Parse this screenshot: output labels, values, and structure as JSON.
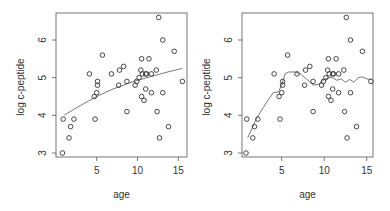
{
  "chart_data": [
    {
      "type": "scatter",
      "title": "",
      "xlabel": "age",
      "ylabel": "log c-peptide",
      "xlim": [
        0.5,
        15.8
      ],
      "ylim": [
        2.9,
        6.75
      ],
      "xticks": [
        5,
        10,
        15
      ],
      "yticks": [
        3,
        4,
        5,
        6
      ],
      "grid": false,
      "points": [
        [
          0.9,
          3.9
        ],
        [
          2.2,
          3.9
        ],
        [
          1.8,
          3.7
        ],
        [
          1.6,
          3.4
        ],
        [
          0.8,
          3.0
        ],
        [
          4.8,
          3.9
        ],
        [
          5.7,
          5.6
        ],
        [
          4.1,
          5.1
        ],
        [
          5.1,
          4.9
        ],
        [
          5.1,
          4.8
        ],
        [
          5.0,
          4.6
        ],
        [
          4.7,
          4.5
        ],
        [
          6.8,
          5.1
        ],
        [
          7.8,
          5.2
        ],
        [
          8.3,
          5.3
        ],
        [
          7.7,
          4.8
        ],
        [
          8.7,
          4.9
        ],
        [
          8.7,
          4.1
        ],
        [
          12.6,
          6.6
        ],
        [
          13.1,
          6.0
        ],
        [
          14.5,
          5.7
        ],
        [
          10.5,
          5.5
        ],
        [
          11.4,
          5.5
        ],
        [
          15.5,
          4.9
        ],
        [
          10.4,
          5.2
        ],
        [
          12.3,
          5.2
        ],
        [
          9.7,
          4.8
        ],
        [
          9.9,
          4.9
        ],
        [
          10.2,
          5.0
        ],
        [
          10.6,
          5.1
        ],
        [
          11.0,
          5.1
        ],
        [
          11.1,
          5.1
        ],
        [
          11.7,
          5.1
        ],
        [
          11.0,
          4.7
        ],
        [
          11.7,
          4.6
        ],
        [
          13.1,
          4.6
        ],
        [
          10.5,
          4.5
        ],
        [
          10.8,
          4.4
        ],
        [
          12.4,
          4.1
        ],
        [
          13.8,
          3.7
        ],
        [
          12.7,
          3.4
        ]
      ],
      "fit_line": {
        "name": "smooth fit",
        "x": [
          1.0,
          2.0,
          3.0,
          4.0,
          5.0,
          6.0,
          7.0,
          8.0,
          9.0,
          10.0,
          11.0,
          12.0,
          13.0,
          14.0,
          15.0,
          15.5
        ],
        "y": [
          4.0,
          4.13,
          4.26,
          4.38,
          4.5,
          4.6,
          4.7,
          4.78,
          4.86,
          4.93,
          4.99,
          5.05,
          5.11,
          5.17,
          5.22,
          5.25
        ]
      }
    },
    {
      "type": "scatter",
      "title": "",
      "xlabel": "age",
      "ylabel": "log c-peptide",
      "xlim": [
        0.5,
        15.8
      ],
      "ylim": [
        2.9,
        6.75
      ],
      "xticks": [
        5,
        10,
        15
      ],
      "yticks": [
        3,
        4,
        5,
        6
      ],
      "grid": false,
      "points": [
        [
          0.9,
          3.9
        ],
        [
          2.2,
          3.9
        ],
        [
          1.8,
          3.7
        ],
        [
          1.6,
          3.4
        ],
        [
          0.8,
          3.0
        ],
        [
          4.8,
          3.9
        ],
        [
          5.7,
          5.6
        ],
        [
          4.1,
          5.1
        ],
        [
          5.1,
          4.9
        ],
        [
          5.1,
          4.8
        ],
        [
          5.0,
          4.6
        ],
        [
          4.7,
          4.5
        ],
        [
          6.8,
          5.1
        ],
        [
          7.8,
          5.2
        ],
        [
          8.3,
          5.3
        ],
        [
          7.7,
          4.8
        ],
        [
          8.7,
          4.9
        ],
        [
          8.7,
          4.1
        ],
        [
          12.6,
          6.6
        ],
        [
          13.1,
          6.0
        ],
        [
          14.5,
          5.7
        ],
        [
          10.5,
          5.5
        ],
        [
          11.4,
          5.5
        ],
        [
          15.5,
          4.9
        ],
        [
          10.4,
          5.2
        ],
        [
          12.3,
          5.2
        ],
        [
          9.7,
          4.8
        ],
        [
          9.9,
          4.9
        ],
        [
          10.2,
          5.0
        ],
        [
          10.6,
          5.1
        ],
        [
          11.0,
          5.1
        ],
        [
          11.1,
          5.1
        ],
        [
          11.7,
          5.1
        ],
        [
          11.0,
          4.7
        ],
        [
          11.7,
          4.6
        ],
        [
          13.1,
          4.6
        ],
        [
          10.5,
          4.5
        ],
        [
          10.8,
          4.4
        ],
        [
          12.4,
          4.1
        ],
        [
          13.8,
          3.7
        ],
        [
          12.7,
          3.4
        ]
      ],
      "fit_line": {
        "name": "local smooth fit",
        "x": [
          1.0,
          2.0,
          2.8,
          4.0,
          4.6,
          5.0,
          5.4,
          5.8,
          6.6,
          7.2,
          8.0,
          8.7,
          9.3,
          10.0,
          10.5,
          11.0,
          11.5,
          12.0,
          12.5,
          13.0,
          13.5,
          14.0,
          14.5,
          15.0,
          15.5
        ],
        "y": [
          3.4,
          3.9,
          4.2,
          4.6,
          4.62,
          4.8,
          5.1,
          5.15,
          5.15,
          5.1,
          4.95,
          4.8,
          4.82,
          4.95,
          5.0,
          5.0,
          4.93,
          4.97,
          4.88,
          4.95,
          4.88,
          5.0,
          5.02,
          4.97,
          4.95
        ]
      }
    }
  ]
}
